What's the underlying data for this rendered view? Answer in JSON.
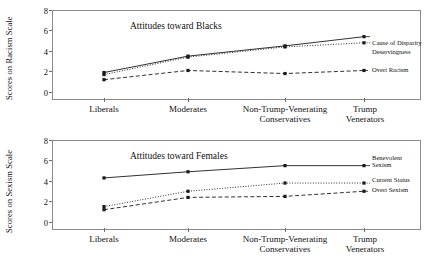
{
  "figure": {
    "panels": [
      {
        "id": "racism-panel",
        "title": "Attitudes toward Blacks",
        "ylabel": "Scores on Racism Scale",
        "yticks": [
          "0",
          "2",
          "4",
          "6",
          "8"
        ],
        "xlabels": [
          {
            "line1": "Liberals",
            "line2": ""
          },
          {
            "line1": "Moderates",
            "line2": ""
          },
          {
            "line1": "Non-Trump-Venerating",
            "line2": "Conservatives"
          },
          {
            "line1": "Trump",
            "line2": "Venerators"
          }
        ],
        "legend": [
          {
            "line1": "Cause of Disparity",
            "line2": ""
          },
          {
            "line1": "Deservingness",
            "line2": ""
          },
          {
            "line1": "Overt Racism",
            "line2": ""
          }
        ]
      },
      {
        "id": "sexism-panel",
        "title": "Attitudes toward Females",
        "ylabel": "Scores on Sexism Scale",
        "yticks": [
          "0",
          "2",
          "4",
          "6",
          "8"
        ],
        "xlabels": [
          {
            "line1": "Liberals",
            "line2": ""
          },
          {
            "line1": "Moderates",
            "line2": ""
          },
          {
            "line1": "Non-Trump-Venerating",
            "line2": "Conservatives"
          },
          {
            "line1": "Trump",
            "line2": "Venerators"
          }
        ],
        "legend": [
          {
            "line1": "Benevolent",
            "line2": "Sexism"
          },
          {
            "line1": "Current Status",
            "line2": ""
          },
          {
            "line1": "Overt Sexism",
            "line2": ""
          }
        ]
      }
    ]
  },
  "chart_data": [
    {
      "type": "line",
      "title": "Attitudes toward Blacks",
      "xlabel": "",
      "ylabel": "Scores on Racism Scale",
      "ylim": [
        0,
        8
      ],
      "yticks": [
        0,
        2,
        4,
        6,
        8
      ],
      "grid": false,
      "legend_position": "right-inline",
      "categories": [
        "Liberals",
        "Moderates",
        "Non-Trump-Venerating Conservatives",
        "Trump Venerators"
      ],
      "series": [
        {
          "name": "Cause of Disparity",
          "values": [
            1.9,
            3.5,
            4.5,
            5.4
          ],
          "style": "solid",
          "marker": "square"
        },
        {
          "name": "Deservingness",
          "values": [
            1.7,
            3.4,
            4.4,
            4.8
          ],
          "style": "dotted",
          "marker": "square"
        },
        {
          "name": "Overt Racism",
          "values": [
            1.2,
            2.1,
            1.8,
            2.1
          ],
          "style": "dashed",
          "marker": "square"
        }
      ]
    },
    {
      "type": "line",
      "title": "Attitudes toward Females",
      "xlabel": "",
      "ylabel": "Scores on Sexism Scale",
      "ylim": [
        0,
        8
      ],
      "yticks": [
        0,
        2,
        4,
        6,
        8
      ],
      "grid": false,
      "legend_position": "right-inline",
      "categories": [
        "Liberals",
        "Moderates",
        "Non-Trump-Venerating Conservatives",
        "Trump Venerators"
      ],
      "series": [
        {
          "name": "Benevolent Sexism",
          "values": [
            4.3,
            4.9,
            5.5,
            5.5
          ],
          "style": "solid",
          "marker": "square"
        },
        {
          "name": "Current Status",
          "values": [
            1.5,
            3.0,
            3.8,
            3.8
          ],
          "style": "dotted",
          "marker": "square"
        },
        {
          "name": "Overt Sexism",
          "values": [
            1.2,
            2.4,
            2.5,
            3.0
          ],
          "style": "dashed",
          "marker": "square"
        }
      ]
    }
  ]
}
